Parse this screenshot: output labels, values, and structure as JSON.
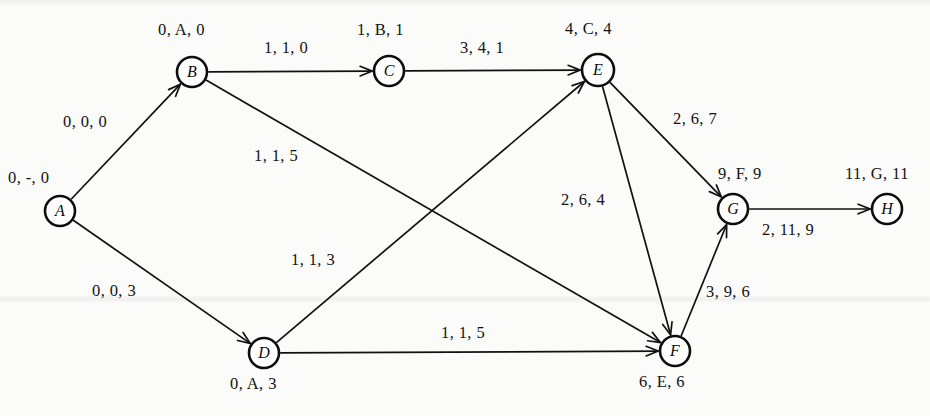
{
  "figure": {
    "kind": "directed-graph",
    "background_color": "#fbfbfa",
    "ink_color": "#111111",
    "node_radius": 15
  },
  "nodes": [
    {
      "id": "A",
      "letter": "A",
      "cx": 60,
      "cy": 211,
      "r": 15,
      "label": "0, -, 0",
      "label_x": 8,
      "label_y": 170
    },
    {
      "id": "B",
      "letter": "B",
      "cx": 192,
      "cy": 72,
      "r": 15,
      "label": "0, A, 0",
      "label_x": 158,
      "label_y": 22
    },
    {
      "id": "C",
      "letter": "C",
      "cx": 389,
      "cy": 71,
      "r": 15,
      "label": "1, B, 1",
      "label_x": 357,
      "label_y": 22
    },
    {
      "id": "D",
      "letter": "D",
      "cx": 264,
      "cy": 353,
      "r": 15,
      "label": "0, A, 3",
      "label_x": 230,
      "label_y": 376
    },
    {
      "id": "E",
      "letter": "E",
      "cx": 598,
      "cy": 70,
      "r": 16,
      "label": "4, C, 4",
      "label_x": 565,
      "label_y": 21
    },
    {
      "id": "F",
      "letter": "F",
      "cx": 675,
      "cy": 351,
      "r": 15,
      "label": "6, E, 6",
      "label_x": 639,
      "label_y": 374
    },
    {
      "id": "G",
      "letter": "G",
      "cx": 733,
      "cy": 209,
      "r": 15,
      "label": "9, F, 9",
      "label_x": 718,
      "label_y": 166
    },
    {
      "id": "H",
      "letter": "H",
      "cx": 887,
      "cy": 209,
      "r": 15,
      "label": "11, G, 11",
      "label_x": 845,
      "label_y": 166
    }
  ],
  "edges": [
    {
      "id": "A-B",
      "from": "A",
      "to": "B",
      "label": "0, 0, 0",
      "label_x": 63,
      "label_y": 114
    },
    {
      "id": "A-D",
      "from": "A",
      "to": "D",
      "label": "0, 0, 3",
      "label_x": 92,
      "label_y": 283
    },
    {
      "id": "B-C",
      "from": "B",
      "to": "C",
      "label": "1, 1, 0",
      "label_x": 264,
      "label_y": 40
    },
    {
      "id": "B-F",
      "from": "B",
      "to": "F",
      "label": "1, 1, 5",
      "label_x": 254,
      "label_y": 148
    },
    {
      "id": "C-E",
      "from": "C",
      "to": "E",
      "label": "3, 4, 1",
      "label_x": 460,
      "label_y": 40
    },
    {
      "id": "D-E",
      "from": "D",
      "to": "E",
      "label": "1, 1, 3",
      "label_x": 291,
      "label_y": 252
    },
    {
      "id": "D-F",
      "from": "D",
      "to": "F",
      "label": "1, 1, 5",
      "label_x": 441,
      "label_y": 325
    },
    {
      "id": "E-G",
      "from": "E",
      "to": "G",
      "label": "2, 6, 7",
      "label_x": 673,
      "label_y": 111
    },
    {
      "id": "E-F",
      "from": "E",
      "to": "F",
      "label": "2, 6, 4",
      "label_x": 561,
      "label_y": 192
    },
    {
      "id": "F-G",
      "from": "F",
      "to": "G",
      "label": "3, 9, 6",
      "label_x": 706,
      "label_y": 284
    },
    {
      "id": "G-H",
      "from": "G",
      "to": "H",
      "label": "2, 11, 9",
      "label_x": 762,
      "label_y": 222
    }
  ]
}
